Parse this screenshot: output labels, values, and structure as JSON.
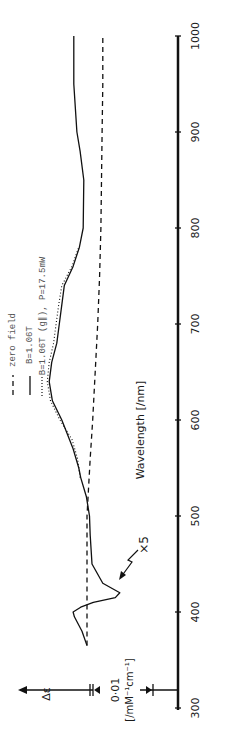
{
  "chart_data": {
    "type": "line",
    "orientation": "rotated-90deg-ccw",
    "title": "",
    "xlabel": "Wavelength [/nm]",
    "ylabel": "Δε",
    "scale_bar": {
      "value": "0·01",
      "unit": "[/mM⁻¹cm⁻¹]"
    },
    "x_ticks": [
      300,
      400,
      500,
      600,
      700,
      800,
      900,
      1000
    ],
    "xlim": [
      300,
      1000
    ],
    "annotation": "×5",
    "legend": [
      {
        "style": "dashed",
        "label": "zero field"
      },
      {
        "style": "solid",
        "label": "B=1.06T"
      },
      {
        "style": "dotted",
        "label": "B=1.06T (g∥), P=17.5mW"
      }
    ],
    "series": [
      {
        "name": "zero field",
        "style": "dashed",
        "x": [
          365,
          420,
          500,
          560,
          600,
          650,
          700,
          750,
          800,
          850,
          900,
          950,
          1000
        ],
        "y": [
          0.0,
          0.0,
          0.0,
          -0.5,
          -0.9,
          -1.3,
          -1.7,
          -2.0,
          -2.2,
          -2.3,
          -2.4,
          -2.5,
          -2.5
        ]
      },
      {
        "name": "B=1.06T",
        "style": "solid",
        "x": [
          365,
          380,
          395,
          400,
          405,
          410,
          415,
          420,
          430,
          450,
          480,
          500,
          520,
          540,
          550,
          570,
          600,
          620,
          640,
          660,
          680,
          700,
          720,
          740,
          760,
          780,
          800,
          850,
          880,
          900,
          950,
          1000
        ],
        "y": [
          0.0,
          0.8,
          2.0,
          2.2,
          1.0,
          -1.0,
          -4.5,
          -5.2,
          -2.5,
          -0.8,
          -0.5,
          -0.4,
          0.1,
          1.0,
          1.3,
          2.2,
          4.0,
          5.5,
          6.0,
          5.6,
          4.8,
          4.4,
          4.0,
          3.6,
          2.2,
          1.2,
          0.6,
          0.5,
          1.1,
          1.6,
          2.1,
          2.1
        ]
      },
      {
        "name": "B=1.06T (g∥), P=17.5mW",
        "style": "dotted",
        "x": [
          540,
          560,
          580,
          600,
          620,
          640,
          660,
          680,
          700,
          720,
          740,
          760,
          780
        ],
        "y": [
          1.1,
          1.5,
          2.4,
          4.3,
          5.8,
          6.3,
          6.0,
          5.3,
          4.9,
          4.5,
          4.0,
          2.4,
          1.3
        ]
      }
    ]
  }
}
